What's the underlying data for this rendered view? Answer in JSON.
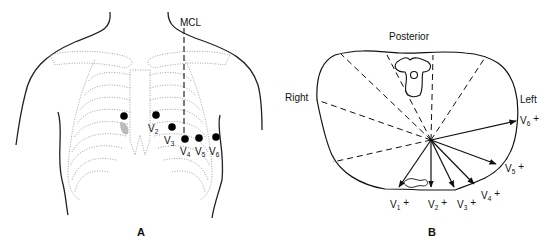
{
  "panel_a": {
    "label": "A",
    "mcl_label": "MCL",
    "electrodes": [
      {
        "lead": "V",
        "sub": "1",
        "show_label": false
      },
      {
        "lead": "V",
        "sub": "2",
        "show_label": true
      },
      {
        "lead": "V",
        "sub": "3",
        "show_label": true
      },
      {
        "lead": "V",
        "sub": "4",
        "show_label": true
      },
      {
        "lead": "V",
        "sub": "5",
        "show_label": true
      },
      {
        "lead": "V",
        "sub": "6",
        "show_label": true
      }
    ]
  },
  "panel_b": {
    "label": "B",
    "posterior_label": "Posterior",
    "right_label": "Right",
    "left_label": "Left",
    "vectors": [
      {
        "lead": "V",
        "sub": "1",
        "sign": "+"
      },
      {
        "lead": "V",
        "sub": "2",
        "sign": "+"
      },
      {
        "lead": "V",
        "sub": "3",
        "sign": "+"
      },
      {
        "lead": "V",
        "sub": "4",
        "sign": "+"
      },
      {
        "lead": "V",
        "sub": "5",
        "sign": "+"
      },
      {
        "lead": "V",
        "sub": "6",
        "sign": "+"
      }
    ]
  }
}
